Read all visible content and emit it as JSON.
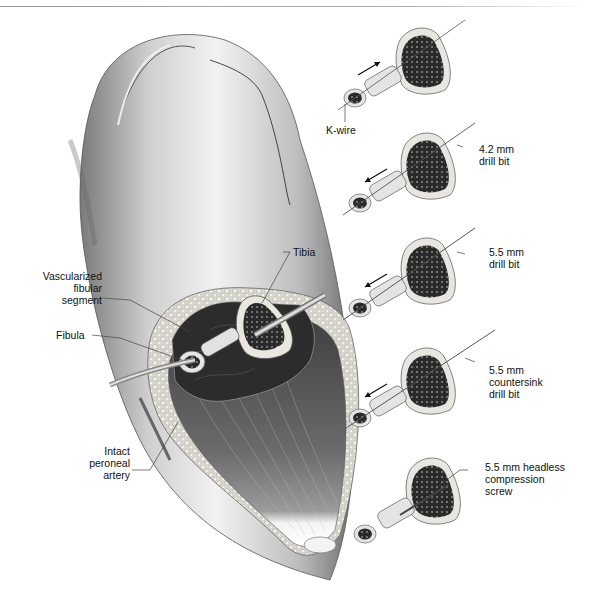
{
  "figure": {
    "type": "surgical-illustration",
    "main_labels": {
      "tibia": "Tibia",
      "vascularized_fibular_segment": [
        "Vascularized",
        "fibular",
        "segment"
      ],
      "fibula": "Fibula",
      "intact_peroneal_artery": [
        "Intact",
        "peroneal",
        "artery"
      ]
    },
    "steps": [
      {
        "label": [
          "K-wire"
        ],
        "direction": "toward-tibia"
      },
      {
        "label": [
          "4.2 mm",
          "drill bit"
        ],
        "direction": "away-from-tibia"
      },
      {
        "label": [
          "5.5 mm",
          "drill bit"
        ],
        "direction": "away-from-tibia"
      },
      {
        "label": [
          "5.5 mm",
          "countersink",
          "drill bit"
        ],
        "direction": "away-from-tibia"
      },
      {
        "label": [
          "5.5 mm headless",
          "compression",
          "screw"
        ],
        "direction": "none"
      }
    ]
  }
}
